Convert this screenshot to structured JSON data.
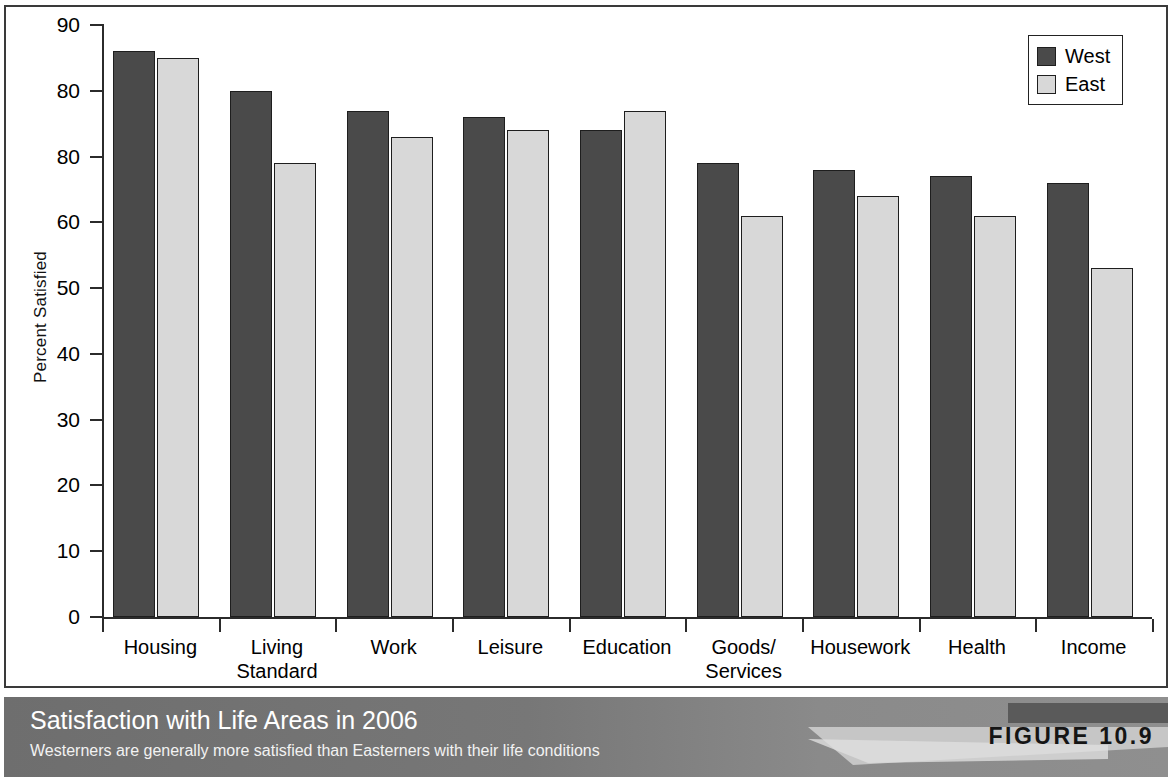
{
  "chart_data": {
    "type": "bar",
    "title": "Satisfaction with Life Areas in 2006",
    "subtitle": "Westerners are generally more satisfied than Easterners with their life conditions",
    "figure_number": "FIGURE 10.9",
    "xlabel": "",
    "ylabel": "Percent Satisfied",
    "ylim": [
      0,
      90
    ],
    "ytick_labels": [
      "90",
      "80",
      "80",
      "60",
      "50",
      "40",
      "30",
      "20",
      "10",
      "0"
    ],
    "ytick_values": [
      90,
      80,
      70,
      60,
      50,
      40,
      30,
      20,
      10,
      0
    ],
    "grid": false,
    "legend_position": "top-right",
    "categories": [
      "Housing",
      "Living\nStandard",
      "Work",
      "Leisure",
      "Education",
      "Goods/\nServices",
      "Housework",
      "Health",
      "Income"
    ],
    "series": [
      {
        "name": "West",
        "color": "#4a4a4a",
        "values": [
          86,
          80,
          77,
          76,
          74,
          69,
          68,
          67,
          66
        ]
      },
      {
        "name": "East",
        "color": "#d8d8d8",
        "values": [
          85,
          69,
          73,
          74,
          77,
          61,
          64,
          61,
          53
        ]
      }
    ]
  },
  "legend": {
    "entries": [
      {
        "label": "West",
        "swatch": "west"
      },
      {
        "label": "East",
        "swatch": "east"
      }
    ]
  },
  "colors": {
    "west_bar": "#4a4a4a",
    "east_bar": "#d8d8d8",
    "axis": "#2b2b2b",
    "caption_bar": "#7b7b7b",
    "caption_text": "#ffffff"
  }
}
